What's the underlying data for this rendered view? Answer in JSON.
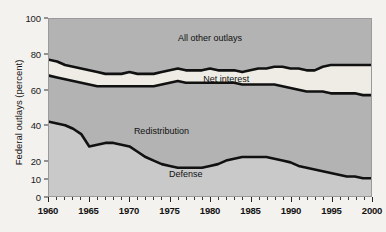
{
  "chart_data": {
    "type": "area",
    "title": "",
    "subtitle": "",
    "xlabel": "",
    "ylabel": "Federal outlays (percent)",
    "xlim": [
      1960,
      2000
    ],
    "ylim": [
      0,
      100
    ],
    "grid": false,
    "legend_position": "inline-annotations",
    "stacked": true,
    "x": [
      1960,
      1961,
      1962,
      1963,
      1964,
      1965,
      1966,
      1967,
      1968,
      1969,
      1970,
      1971,
      1972,
      1973,
      1974,
      1975,
      1976,
      1977,
      1978,
      1979,
      1980,
      1981,
      1982,
      1983,
      1984,
      1985,
      1986,
      1987,
      1988,
      1989,
      1990,
      1991,
      1992,
      1993,
      1994,
      1995,
      1996,
      1997,
      1998,
      1999,
      2000
    ],
    "y_tick_labels": [
      "0",
      "10",
      "20",
      "40",
      "60",
      "80",
      "100"
    ],
    "y_tick_values": [
      0,
      10,
      20,
      40,
      60,
      80,
      100
    ],
    "x_tick_labels": [
      "1960",
      "1965",
      "1970",
      "1975",
      "1980",
      "1985",
      "1990",
      "1995",
      "2000"
    ],
    "x_tick_values": [
      1960,
      1965,
      1970,
      1975,
      1980,
      1985,
      1990,
      1995,
      2000
    ],
    "x_minor_tick_step": 1,
    "series": [
      {
        "name": "Defense",
        "fill": "#c9c9c9",
        "label_x": 1977,
        "label_y": 13,
        "values": [
          42,
          41,
          40,
          38,
          35,
          28,
          29,
          30,
          30,
          29,
          28,
          25,
          22,
          20,
          18,
          17,
          16,
          16,
          16,
          16,
          17,
          18,
          20,
          21,
          22,
          22,
          22,
          22,
          21,
          20,
          19,
          17,
          16,
          15,
          14,
          13,
          12,
          11,
          11,
          10,
          10
        ]
      },
      {
        "name": "Redistribution",
        "fill": "#b3b3b3",
        "label_x": 1974,
        "label_y": 37,
        "cumulative_top": [
          68,
          67,
          66,
          65,
          64,
          63,
          62,
          62,
          62,
          62,
          62,
          62,
          62,
          62,
          63,
          64,
          65,
          64,
          64,
          64,
          64,
          64,
          64,
          64,
          63,
          63,
          63,
          63,
          63,
          62,
          61,
          60,
          59,
          59,
          59,
          58,
          58,
          58,
          58,
          57,
          57
        ],
        "values": [
          26,
          26,
          26,
          27,
          29,
          35,
          33,
          32,
          32,
          33,
          34,
          37,
          40,
          42,
          45,
          47,
          49,
          48,
          48,
          48,
          47,
          46,
          44,
          43,
          41,
          41,
          41,
          41,
          42,
          42,
          42,
          43,
          43,
          44,
          45,
          45,
          46,
          47,
          47,
          47,
          47
        ]
      },
      {
        "name": "Net interest",
        "fill": "#eeece4",
        "label_x": 1982,
        "label_y": 66,
        "cumulative_top": [
          77,
          76,
          74,
          73,
          72,
          71,
          70,
          69,
          69,
          69,
          70,
          69,
          69,
          69,
          70,
          71,
          72,
          71,
          71,
          71,
          72,
          71,
          71,
          71,
          70,
          71,
          72,
          72,
          73,
          73,
          72,
          72,
          71,
          71,
          73,
          74,
          74,
          74,
          74,
          74,
          74
        ],
        "values": [
          9,
          9,
          8,
          8,
          8,
          8,
          8,
          7,
          7,
          7,
          8,
          7,
          7,
          7,
          7,
          7,
          7,
          7,
          7,
          7,
          8,
          7,
          7,
          7,
          7,
          8,
          9,
          9,
          10,
          11,
          11,
          12,
          12,
          12,
          14,
          16,
          16,
          16,
          16,
          17,
          17
        ]
      },
      {
        "name": "All other outlays",
        "fill": "#b3b3b3",
        "label_x": 1980,
        "label_y": 89,
        "cumulative_top": [
          100,
          100,
          100,
          100,
          100,
          100,
          100,
          100,
          100,
          100,
          100,
          100,
          100,
          100,
          100,
          100,
          100,
          100,
          100,
          100,
          100,
          100,
          100,
          100,
          100,
          100,
          100,
          100,
          100,
          100,
          100,
          100,
          100,
          100,
          100,
          100,
          100,
          100,
          100,
          100,
          100
        ],
        "values": [
          23,
          24,
          26,
          27,
          28,
          29,
          30,
          31,
          31,
          31,
          30,
          31,
          31,
          31,
          30,
          29,
          28,
          29,
          29,
          29,
          28,
          29,
          29,
          29,
          30,
          29,
          28,
          28,
          27,
          27,
          28,
          28,
          29,
          29,
          27,
          26,
          26,
          26,
          26,
          26,
          26
        ]
      }
    ]
  },
  "colors": {
    "background": "#f4f2ee",
    "plot_background": "#b8b8b8",
    "band_defense": "#c9c9c9",
    "band_redistribution": "#b3b3b3",
    "band_net_interest": "#eeece4",
    "band_all_other": "#b3b3b3",
    "line": "#111111",
    "axis": "#333333",
    "text": "#111111"
  }
}
